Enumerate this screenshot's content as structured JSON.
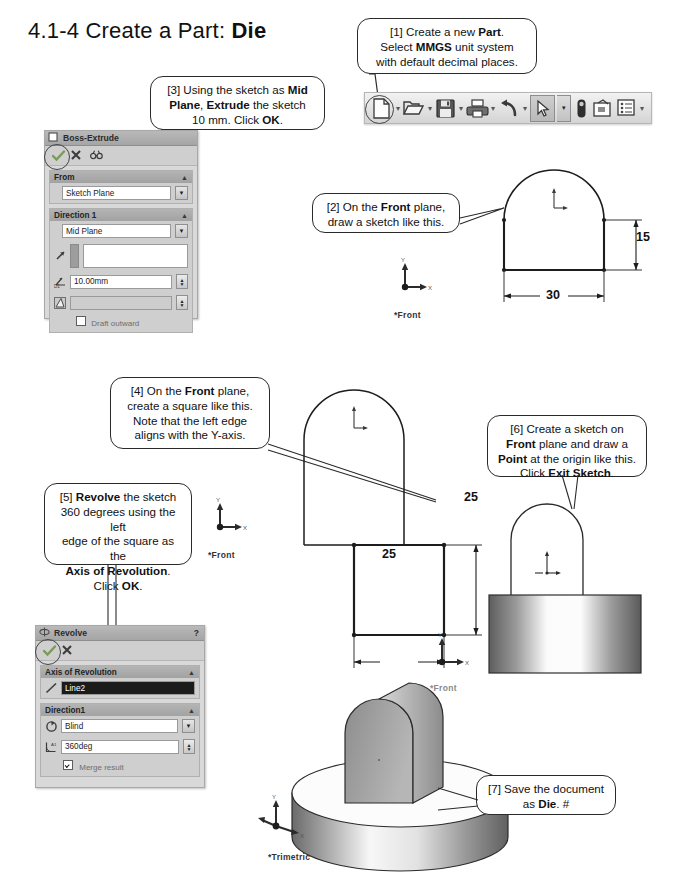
{
  "page": {
    "title_prefix": "4.1-4  Create a Part: ",
    "title_bold": "Die"
  },
  "callouts": [
    {
      "id": "c1",
      "name": "callout-step-1",
      "lines": [
        [
          {
            "t": "[1] Create a new "
          },
          {
            "t": "Part",
            "b": true
          },
          {
            "t": "."
          }
        ],
        [
          {
            "t": "Select "
          },
          {
            "t": "MMGS",
            "b": true
          },
          {
            "t": " unit system"
          }
        ],
        [
          {
            "t": "with default decimal places."
          }
        ]
      ]
    },
    {
      "id": "c2",
      "name": "callout-step-2",
      "lines": [
        [
          {
            "t": "[2] On the "
          },
          {
            "t": "Front",
            "b": true
          },
          {
            "t": " plane,"
          }
        ],
        [
          {
            "t": "draw a sketch like this."
          }
        ]
      ]
    },
    {
      "id": "c3",
      "name": "callout-step-3",
      "lines": [
        [
          {
            "t": "[3] Using the sketch as "
          },
          {
            "t": "Mid",
            "b": true
          }
        ],
        [
          {
            "t": "Plane",
            "b": true
          },
          {
            "t": ", "
          },
          {
            "t": "Extrude",
            "b": true
          },
          {
            "t": " the sketch"
          }
        ],
        [
          {
            "t": "10 mm.  Click "
          },
          {
            "t": "OK",
            "b": true
          },
          {
            "t": "."
          }
        ]
      ]
    },
    {
      "id": "c4",
      "name": "callout-step-4",
      "lines": [
        [
          {
            "t": "[4] On the "
          },
          {
            "t": "Front",
            "b": true
          },
          {
            "t": " plane,"
          }
        ],
        [
          {
            "t": "create a square like this."
          }
        ],
        [
          {
            "t": "Note that the left edge"
          }
        ],
        [
          {
            "t": "aligns with the Y-axis."
          }
        ]
      ]
    },
    {
      "id": "c5",
      "name": "callout-step-5",
      "lines": [
        [
          {
            "t": "[5] "
          },
          {
            "t": "Revolve",
            "b": true
          },
          {
            "t": " the sketch"
          }
        ],
        [
          {
            "t": "360 degrees using the left"
          }
        ],
        [
          {
            "t": "edge of the square as the"
          }
        ],
        [
          {
            "t": "Axis of Revolution",
            "b": true
          },
          {
            "t": "."
          }
        ],
        [
          {
            "t": "Click "
          },
          {
            "t": "OK",
            "b": true
          },
          {
            "t": "."
          }
        ]
      ]
    },
    {
      "id": "c6",
      "name": "callout-step-6",
      "lines": [
        [
          {
            "t": "[6] Create a sketch on"
          }
        ],
        [
          {
            "t": "Front",
            "b": true
          },
          {
            "t": " plane and draw a"
          }
        ],
        [
          {
            "t": "Point",
            "b": true
          },
          {
            "t": " at the origin like this."
          }
        ],
        [
          {
            "t": "Click "
          },
          {
            "t": "Exit Sketch",
            "b": true
          },
          {
            "t": "."
          }
        ]
      ]
    },
    {
      "id": "c7",
      "name": "callout-step-7",
      "lines": [
        [
          {
            "t": "[7] Save the document"
          }
        ],
        [
          {
            "t": "as "
          },
          {
            "t": "Die",
            "b": true
          },
          {
            "t": ". #"
          }
        ]
      ]
    }
  ],
  "toolbar": {
    "name": "standard-toolbar",
    "buttons": [
      {
        "name": "new-document-icon",
        "label": "New"
      },
      {
        "name": "open-document-icon",
        "label": "Open"
      },
      {
        "name": "save-icon",
        "label": "Save"
      },
      {
        "name": "print-icon",
        "label": "Print"
      },
      {
        "name": "undo-icon",
        "label": "Undo"
      },
      {
        "name": "select-icon",
        "label": "Select"
      },
      {
        "name": "rebuild-icon",
        "label": "Rebuild"
      },
      {
        "name": "file-properties-icon",
        "label": "File Properties"
      },
      {
        "name": "options-icon",
        "label": "Options"
      }
    ]
  },
  "boss_extrude_panel": {
    "title": "Boss-Extrude",
    "help": "",
    "tools": [
      "ok-check-icon",
      "cancel-x-icon",
      "preview-glasses-icon"
    ],
    "groups": [
      {
        "header": "From",
        "rows": [
          {
            "type": "dropdown",
            "value": "Sketch Plane"
          }
        ]
      },
      {
        "header": "Direction 1",
        "rows": [
          {
            "type": "dropdown",
            "value": "Mid Plane",
            "icon": "direction-arrow-icon"
          },
          {
            "type": "field",
            "value": "",
            "icon": "reverse-direction-icon"
          },
          {
            "type": "spin",
            "value": "10.00mm",
            "icon": "depth-icon"
          },
          {
            "type": "spin",
            "value": "",
            "icon": "draft-icon"
          }
        ]
      }
    ],
    "footer_checkbox": {
      "label": "Draft outward",
      "checked": false
    }
  },
  "revolve_panel": {
    "title": "Revolve",
    "help": "?",
    "tools": [
      "ok-check-icon",
      "cancel-x-icon"
    ],
    "groups": [
      {
        "header": "Axis of Revolution",
        "rows": [
          {
            "type": "selected",
            "value": "Line2",
            "icon": "axis-line-icon"
          }
        ]
      },
      {
        "header": "Direction1",
        "rows": [
          {
            "type": "dropdown",
            "value": "Blind",
            "icon": "revolve-direction-icon"
          },
          {
            "type": "spin",
            "value": "360deg",
            "icon": "angle-icon"
          }
        ]
      }
    ],
    "footer_checkbox": {
      "label": "Merge result",
      "checked": true
    }
  },
  "drawings": {
    "sketch1": {
      "name": "sketch-dome-30x15",
      "dim_width": "30",
      "dim_height": "15",
      "plane_label": "*Front",
      "axis": {
        "x": "X",
        "y": "Y"
      }
    },
    "sketch2": {
      "name": "sketch-square-25x25",
      "dim_width": "25",
      "dim_height": "25",
      "plane_label": "*Front",
      "axis": {
        "x": "X",
        "y": "Y"
      }
    },
    "model_front": {
      "name": "model-front-view",
      "plane_label": "*Front",
      "axis": {
        "x": "X",
        "y": "Y"
      }
    },
    "model_trimetric": {
      "name": "model-trimetric-view",
      "plane_label": "*Trimetric",
      "axis": {
        "x": "X",
        "y": "Y",
        "z": "Z"
      }
    }
  }
}
